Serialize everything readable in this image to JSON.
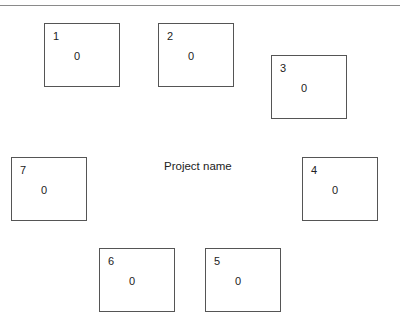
{
  "diagram": {
    "center_label": "Project name",
    "boxes": [
      {
        "id": "1",
        "number": "1",
        "value": "0",
        "x": 44,
        "y": 23
      },
      {
        "id": "2",
        "number": "2",
        "value": "0",
        "x": 158,
        "y": 23
      },
      {
        "id": "3",
        "number": "3",
        "value": "0",
        "x": 271,
        "y": 55
      },
      {
        "id": "4",
        "number": "4",
        "value": "0",
        "x": 302,
        "y": 157
      },
      {
        "id": "5",
        "number": "5",
        "value": "0",
        "x": 205,
        "y": 248
      },
      {
        "id": "6",
        "number": "6",
        "value": "0",
        "x": 99,
        "y": 248
      },
      {
        "id": "7",
        "number": "7",
        "value": "0",
        "x": 11,
        "y": 157
      }
    ]
  },
  "colors": {
    "border": "#555555",
    "text": "#222222",
    "rule": "#8a8a8a",
    "background": "#ffffff"
  }
}
